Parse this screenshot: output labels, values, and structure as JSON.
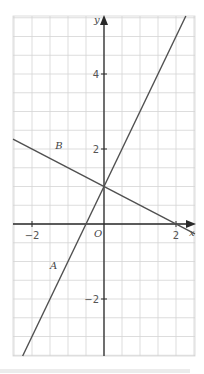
{
  "chart_data": {
    "type": "line",
    "title": "",
    "xlabel": "x",
    "ylabel": "y",
    "origin_label": "O",
    "xlim": [
      -2.5,
      2.5
    ],
    "ylim": [
      -3.5,
      5.5
    ],
    "grid": true,
    "grid_step": 0.5,
    "x_ticks": [
      {
        "value": -2,
        "label": "−2"
      },
      {
        "value": 2,
        "label": "2"
      }
    ],
    "y_ticks": [
      {
        "value": 4,
        "label": "4"
      },
      {
        "value": 2,
        "label": "2"
      },
      {
        "value": -2,
        "label": "−2"
      }
    ],
    "series": [
      {
        "name": "A",
        "slope": 2,
        "intercept": 1,
        "label_at": [
          -1.4,
          -1.2
        ],
        "color": "#505050"
      },
      {
        "name": "B",
        "slope": -0.5,
        "intercept": 1,
        "label_at": [
          -1.25,
          2.0
        ],
        "color": "#505050"
      }
    ]
  }
}
